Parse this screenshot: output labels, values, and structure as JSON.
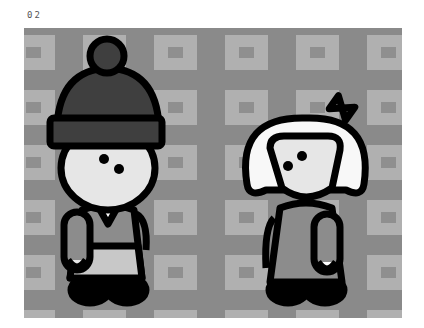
{
  "frame": {
    "label": "02"
  },
  "scene": {
    "description": "Two cartoon children standing on a tiled gray background",
    "colors": {
      "background": "#8a8a8a",
      "tile_light": "#b0b0b0",
      "tile_inner": "#8f8f8f",
      "outline": "#000000",
      "skin": "#e6e6e6",
      "hat": "#3f3f3f",
      "hair": "#f8f8f8",
      "shirt": "#8c8c8c",
      "skirt": "#c8c8c8"
    },
    "characters": [
      {
        "name": "boy",
        "accessory": "beanie-hat"
      },
      {
        "name": "girl",
        "accessory": "hair-bow"
      }
    ]
  }
}
